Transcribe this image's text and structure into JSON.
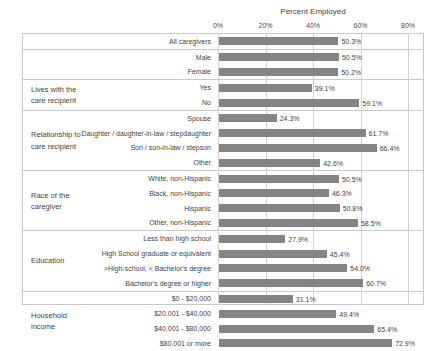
{
  "chart_data": {
    "type": "bar",
    "orientation": "horizontal",
    "title": "Percent Employed",
    "xlabel": "",
    "ylabel": "",
    "xlim": [
      0,
      80
    ],
    "tick_labels": [
      "0%",
      "20%",
      "40%",
      "60%",
      "80%"
    ],
    "tick_values": [
      0,
      20,
      40,
      60,
      80
    ],
    "grid": true,
    "legend": "none",
    "bar_color": "#848484",
    "value_suffix": "%",
    "groups": [
      {
        "group_label": "",
        "categories": [
          "All caregivers"
        ],
        "values": [
          50.3
        ],
        "value_labels": [
          "50.3%"
        ]
      },
      {
        "group_label": "Sex",
        "categories": [
          "Male",
          "Female"
        ],
        "values": [
          50.5,
          50.2
        ],
        "value_labels": [
          "50.5%",
          "50.2%"
        ]
      },
      {
        "group_label": "Lives with the\ncare recipient",
        "group_label_lines": [
          "Lives with the",
          "care recipient"
        ],
        "categories": [
          "Yes",
          "No"
        ],
        "values": [
          39.1,
          59.1
        ],
        "value_labels": [
          "39.1%",
          "59.1%"
        ]
      },
      {
        "group_label": "Relationship to\ncare recipient",
        "group_label_lines": [
          "Relationship to",
          "care recipient"
        ],
        "categories": [
          "Spouse",
          "Daughter / daughter-in-law / stepdaughter",
          "Son / son-in-law / stepson",
          "Other"
        ],
        "values": [
          24.3,
          61.7,
          66.4,
          42.6
        ],
        "value_labels": [
          "24.3%",
          "61.7%",
          "66.4%",
          "42.6%"
        ]
      },
      {
        "group_label": "Race of the\ncaregiver",
        "group_label_lines": [
          "Race of the",
          "caregiver"
        ],
        "categories": [
          "White, non-Hispanic",
          "Black, non-Hispanic",
          "Hispanic",
          "Other, non-Hispanic"
        ],
        "values": [
          50.5,
          46.3,
          50.8,
          58.5
        ],
        "value_labels": [
          "50.5%",
          "46.3%",
          "50.8%",
          "58.5%"
        ]
      },
      {
        "group_label": "Education",
        "group_label_lines": [
          "Education"
        ],
        "categories": [
          "Less than high school",
          "High School graduate or equivalent",
          ">High-school, < Bachelor's degree",
          "Bachelor's degree or higher"
        ],
        "values": [
          27.9,
          45.4,
          54.0,
          60.7
        ],
        "value_labels": [
          "27.9%",
          "45.4%",
          "54.0%",
          "60.7%"
        ]
      },
      {
        "group_label": "Household\nincome",
        "group_label_lines": [
          "Household",
          "income"
        ],
        "categories": [
          "$0 - $20,000",
          "$20,001 - $40,000",
          "$40,001 - $80,000",
          "$80,001 or more"
        ],
        "values": [
          31.1,
          49.4,
          65.4,
          72.9
        ],
        "value_labels": [
          "31.1%",
          "49.4%",
          "65.4%",
          "72.9%"
        ]
      }
    ]
  }
}
